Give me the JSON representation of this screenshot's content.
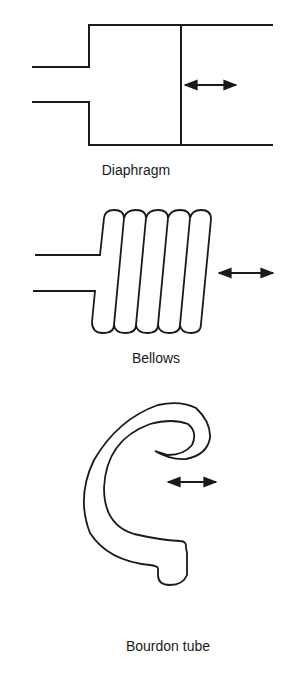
{
  "figure": {
    "panels": [
      {
        "id": "diaphragm",
        "label": "Diaphragm"
      },
      {
        "id": "bellows",
        "label": "Bellows"
      },
      {
        "id": "bourdon",
        "label": "Bourdon tube"
      }
    ],
    "colors": {
      "stroke": "#1a1a1a",
      "background": "#ffffff"
    }
  }
}
